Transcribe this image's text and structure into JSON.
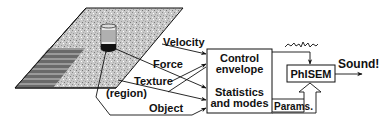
{
  "diagram": {
    "inputs": {
      "velocity": "Velocity",
      "force": "Force",
      "texture": "Texture",
      "region": "(region)",
      "object": "Object"
    },
    "control_box": {
      "line1": "Control",
      "line2": "envelope",
      "line3": "Statistics",
      "line4": "and modes"
    },
    "params_label": "Params.",
    "phisem_label": "PhISEM",
    "output_label": "Sound!",
    "scene": {
      "surface": "textured-plane",
      "object": "can"
    }
  }
}
